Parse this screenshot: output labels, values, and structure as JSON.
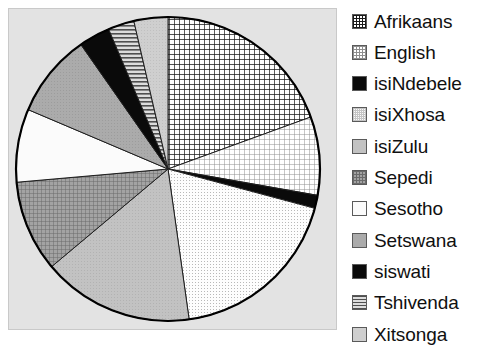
{
  "chart_data": {
    "type": "pie",
    "title": "",
    "xlabel": "",
    "ylabel": "",
    "legend_position": "right",
    "grid": false,
    "start_angle_deg": 0,
    "direction": "clockwise",
    "categories": [
      "Afrikaans",
      "English",
      "isiNdebele",
      "isiXhosa",
      "isiZulu",
      "Sepedi",
      "Sesotho",
      "Setswana",
      "siswati",
      "Tshivenda",
      "Xitsonga"
    ],
    "values": [
      19.4,
      8.3,
      1.4,
      18.6,
      16.1,
      9.7,
      7.8,
      8.9,
      3.3,
      2.8,
      3.6
    ],
    "value_unit": "percent",
    "slices": [
      {
        "label": "Afrikaans",
        "value": 19.4,
        "start_deg": 0,
        "end_deg": 70,
        "fill": "crosshatch-dark",
        "color": "#f2f2f2",
        "pattern_color": "#1a1a1a"
      },
      {
        "label": "English",
        "value": 8.3,
        "start_deg": 70,
        "end_deg": 100,
        "fill": "crosshatch-light",
        "color": "#f7f7f7",
        "pattern_color": "#8a8a8a"
      },
      {
        "label": "isiNdebele",
        "value": 1.4,
        "start_deg": 100,
        "end_deg": 105,
        "fill": "solid",
        "color": "#0a0a0a",
        "pattern_color": "#0a0a0a"
      },
      {
        "label": "isiXhosa",
        "value": 18.6,
        "start_deg": 105,
        "end_deg": 172,
        "fill": "dots-light",
        "color": "#fafafa",
        "pattern_color": "#b5b5b5"
      },
      {
        "label": "isiZulu",
        "value": 16.1,
        "start_deg": 172,
        "end_deg": 230,
        "fill": "solid-gray",
        "color": "#c0c0c0",
        "pattern_color": "#c0c0c0"
      },
      {
        "label": "Sepedi",
        "value": 9.7,
        "start_deg": 230,
        "end_deg": 265,
        "fill": "crosshatch-medium",
        "color": "#9a9a9a",
        "pattern_color": "#6e6e6e"
      },
      {
        "label": "Sesotho",
        "value": 7.8,
        "start_deg": 265,
        "end_deg": 293,
        "fill": "white",
        "color": "#fbfbfb",
        "pattern_color": "#fbfbfb"
      },
      {
        "label": "Setswana",
        "value": 8.9,
        "start_deg": 293,
        "end_deg": 325,
        "fill": "solid-gray-mid",
        "color": "#a8a8a8",
        "pattern_color": "#a8a8a8"
      },
      {
        "label": "siswati",
        "value": 3.3,
        "start_deg": 325,
        "end_deg": 337,
        "fill": "solid",
        "color": "#0a0a0a",
        "pattern_color": "#0a0a0a"
      },
      {
        "label": "Tshivenda",
        "value": 2.8,
        "start_deg": 337,
        "end_deg": 347,
        "fill": "hstripes",
        "color": "#d0d0d0",
        "pattern_color": "#555555"
      },
      {
        "label": "Xitsonga",
        "value": 3.6,
        "start_deg": 347,
        "end_deg": 360,
        "fill": "solid-gray-light",
        "color": "#cccccc",
        "pattern_color": "#cccccc"
      }
    ]
  },
  "legend": {
    "items": [
      {
        "label": "Afrikaans",
        "swatch": "crosshatch-dark"
      },
      {
        "label": "English",
        "swatch": "crosshatch-light"
      },
      {
        "label": "isiNdebele",
        "swatch": "solid-black"
      },
      {
        "label": "isiXhosa",
        "swatch": "dots-light"
      },
      {
        "label": "isiZulu",
        "swatch": "solid-gray"
      },
      {
        "label": "Sepedi",
        "swatch": "crosshatch-medium"
      },
      {
        "label": "Sesotho",
        "swatch": "white"
      },
      {
        "label": "Setswana",
        "swatch": "solid-gray-mid"
      },
      {
        "label": "siswati",
        "swatch": "solid-black"
      },
      {
        "label": "Tshivenda",
        "swatch": "hstripes"
      },
      {
        "label": "Xitsonga",
        "swatch": "solid-gray-light"
      }
    ]
  },
  "plot": {
    "background_color": "#e3e3e3",
    "border_color": "#c9c9c9",
    "outline_color": "#000000"
  }
}
